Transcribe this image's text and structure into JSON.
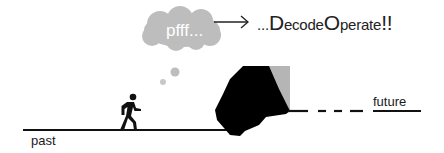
{
  "diagram": {
    "thought_bubble": {
      "text": "pfff...",
      "color": "#bdbdbd",
      "text_color": "#ffffff"
    },
    "arrow": {
      "direction": "right"
    },
    "headline": {
      "prefix": "...",
      "word1_initial": "D",
      "word1_rest": "ecode",
      "word2_initial": "O",
      "word2_rest": "perate",
      "suffix": "!!"
    },
    "timeline": {
      "past_label": "past",
      "future_label": "future",
      "line_color": "#111111"
    },
    "figure": {
      "type": "walking-person-icon",
      "color": "#111111"
    },
    "obstacle": {
      "type": "rock",
      "color": "#000000",
      "accent_color": "#b5b5b5"
    }
  }
}
